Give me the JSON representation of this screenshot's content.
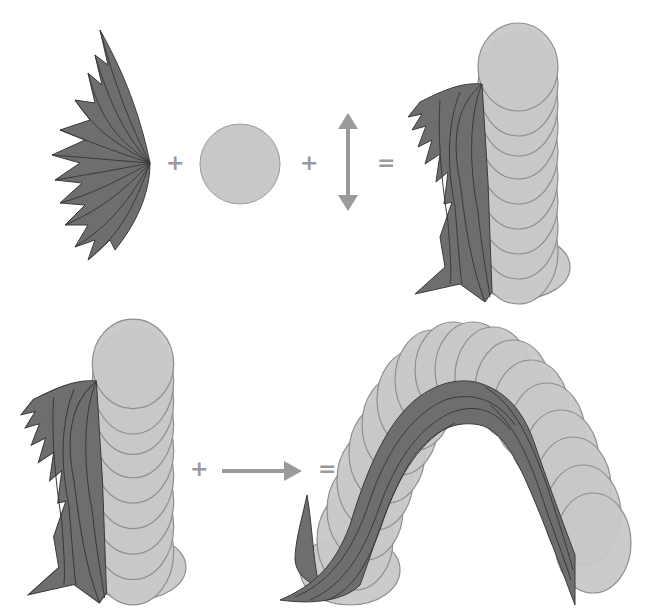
{
  "diagram": {
    "colors": {
      "feather_fill": "#6e6e6e",
      "feather_stroke": "#3a3a3a",
      "disc_fill": "#c8c8c8",
      "disc_stroke": "#8f8f8f",
      "arrow": "#9a9a9a",
      "operator": "#9a9a9a",
      "background": "#ffffff"
    },
    "row1": {
      "items": [
        "feather-fan",
        "disc",
        "vertical-double-arrow",
        "column-stroke"
      ],
      "operators": [
        "+",
        "+",
        "="
      ]
    },
    "row2": {
      "items": [
        "column-stroke",
        "horizontal-arrow",
        "arch-stroke"
      ],
      "operators": [
        "+",
        "="
      ]
    }
  }
}
